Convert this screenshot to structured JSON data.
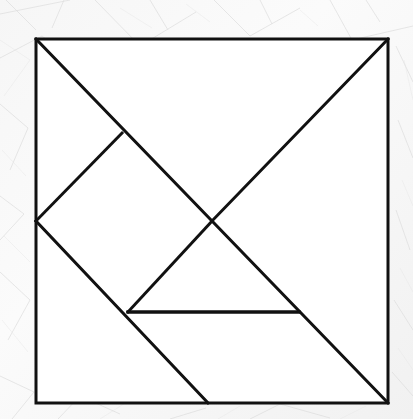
{
  "document": {
    "title": "Tangram Square Dissection",
    "type": "line-diagram",
    "background_color": "#f4f4f4",
    "line_color": "#111111",
    "fill_color": "#ffffff",
    "line_width": 3,
    "canvas": {
      "width": 413,
      "height": 419
    }
  },
  "figure": {
    "name": "tangram-square",
    "outline": {
      "name": "square-border",
      "top_left": [
        36,
        39
      ],
      "top_right": [
        388,
        39
      ],
      "bottom_right": [
        388,
        403
      ],
      "bottom_left": [
        36,
        403
      ]
    },
    "key_points": {
      "top_left": [
        36,
        39
      ],
      "top_right": [
        388,
        39
      ],
      "bottom_right": [
        388,
        403
      ],
      "bottom_left": [
        36,
        403
      ],
      "center": [
        212,
        221
      ],
      "left_mid": [
        36,
        221
      ],
      "diamond_top": [
        122,
        133
      ],
      "diamond_bottom": [
        128,
        312
      ],
      "bottom_edge_point": [
        208,
        403
      ],
      "right_diag_point": [
        299,
        312
      ]
    },
    "cut_lines": [
      {
        "name": "main-diagonal",
        "from": [
          36,
          39
        ],
        "to": [
          388,
          403
        ]
      },
      {
        "name": "anti-diagonal-upper-right",
        "from": [
          212,
          221
        ],
        "to": [
          388,
          39
        ]
      },
      {
        "name": "diamond-upper-left-edge",
        "from": [
          36,
          221
        ],
        "to": [
          122,
          133
        ]
      },
      {
        "name": "left-mid-to-bottom-edge",
        "from": [
          36,
          221
        ],
        "to": [
          208,
          403
        ]
      },
      {
        "name": "diamond-lower-right-edge",
        "from": [
          128,
          312
        ],
        "to": [
          212,
          221
        ]
      },
      {
        "name": "horizontal-base-line",
        "from": [
          128,
          312
        ],
        "to": [
          299,
          312
        ]
      }
    ],
    "pieces": [
      {
        "name": "large-triangle-upper-right",
        "vertices": [
          [
            36,
            39
          ],
          [
            388,
            39
          ],
          [
            212,
            221
          ]
        ]
      },
      {
        "name": "large-triangle-lower-right",
        "vertices": [
          [
            212,
            221
          ],
          [
            388,
            39
          ],
          [
            388,
            403
          ]
        ]
      },
      {
        "name": "parallelogram-left",
        "vertices": [
          [
            36,
            221
          ],
          [
            122,
            133
          ],
          [
            212,
            221
          ],
          [
            128,
            312
          ]
        ]
      },
      {
        "name": "medium-triangle-lower-left",
        "vertices": [
          [
            36,
            221
          ],
          [
            128,
            312
          ],
          [
            208,
            403
          ]
        ]
      },
      {
        "name": "small-triangle-center",
        "vertices": [
          [
            128,
            312
          ],
          [
            212,
            221
          ],
          [
            299,
            312
          ]
        ]
      },
      {
        "name": "sliver-bottom",
        "vertices": [
          [
            128,
            312
          ],
          [
            299,
            312
          ],
          [
            388,
            403
          ],
          [
            208,
            403
          ]
        ]
      }
    ],
    "counts": {
      "cut_line_count": 6,
      "vertex_count": 10
    }
  }
}
